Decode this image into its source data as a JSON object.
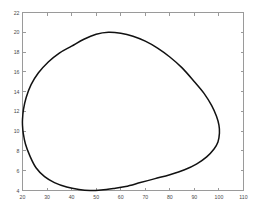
{
  "chart_data": {
    "type": "line",
    "title": "",
    "subtitle": "",
    "xlabel": "",
    "ylabel": "",
    "xlim": [
      20,
      110
    ],
    "ylim": [
      4,
      22
    ],
    "xticks": [
      20,
      30,
      40,
      50,
      60,
      70,
      80,
      90,
      100,
      110
    ],
    "yticks": [
      4,
      6,
      8,
      10,
      12,
      14,
      16,
      18,
      20,
      22
    ],
    "grid": false,
    "legend": null,
    "legend_position": "none",
    "series": [
      {
        "name": "closed contour",
        "closed": true,
        "color": "#111111",
        "linewidth": 1.5,
        "x": [
          20.0,
          20.4,
          21.5,
          23.5,
          26.5,
          30.5,
          35.0,
          40.0,
          45.0,
          50.0,
          55.0,
          60.0,
          65.0,
          70.0,
          75.0,
          80.0,
          85.0,
          90.0,
          94.0,
          97.0,
          99.0,
          100.0,
          100.2,
          99.6,
          98.0,
          95.0,
          91.0,
          86.0,
          80.0,
          74.0,
          68.0,
          62.0,
          57.0,
          52.0,
          47.5,
          43.0,
          38.0,
          33.0,
          29.0,
          25.5,
          23.0,
          21.2,
          20.3,
          20.0
        ],
        "y": [
          11.2,
          12.2,
          13.4,
          14.7,
          15.9,
          17.0,
          17.9,
          18.6,
          19.3,
          19.8,
          20.0,
          19.9,
          19.6,
          19.1,
          18.4,
          17.5,
          16.4,
          15.0,
          13.8,
          12.6,
          11.5,
          10.6,
          9.8,
          8.9,
          8.2,
          7.4,
          6.7,
          6.1,
          5.6,
          5.2,
          4.8,
          4.4,
          4.2,
          4.05,
          4.0,
          4.1,
          4.35,
          4.8,
          5.4,
          6.3,
          7.5,
          8.7,
          9.8,
          10.6
        ]
      }
    ],
    "annotations": []
  }
}
